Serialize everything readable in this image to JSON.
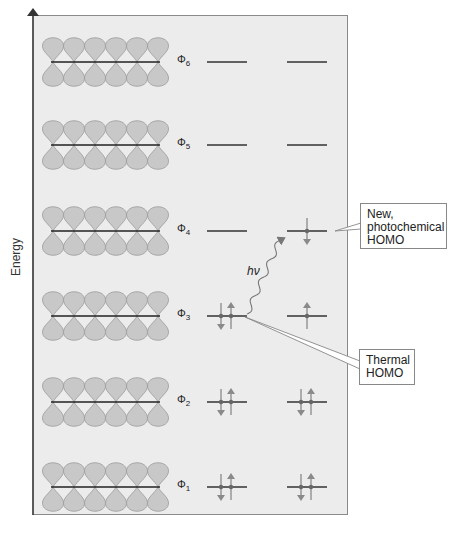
{
  "axis": {
    "label": "Energy"
  },
  "orbitals": [
    {
      "id": "phi6",
      "symbol": "Φ",
      "subscript": "6",
      "y": 62,
      "left_config": "empty",
      "right_config": "empty"
    },
    {
      "id": "phi5",
      "symbol": "Φ",
      "subscript": "5",
      "y": 145,
      "left_config": "empty",
      "right_config": "empty"
    },
    {
      "id": "phi4",
      "symbol": "Φ",
      "subscript": "4",
      "y": 231,
      "left_config": "empty",
      "right_config": "one-down"
    },
    {
      "id": "phi3",
      "symbol": "Φ",
      "subscript": "3",
      "y": 316,
      "left_config": "paired",
      "right_config": "one-up"
    },
    {
      "id": "phi2",
      "symbol": "Φ",
      "subscript": "2",
      "y": 402,
      "left_config": "paired",
      "right_config": "paired"
    },
    {
      "id": "phi1",
      "symbol": "Φ",
      "subscript": "1",
      "y": 487,
      "left_config": "paired",
      "right_config": "paired"
    }
  ],
  "p_orbital_count": 6,
  "excitation": {
    "label": "hν"
  },
  "callouts": {
    "photochemical": {
      "lines": [
        "New,",
        "photochemical",
        "HOMO"
      ]
    },
    "thermal": {
      "lines": [
        "Thermal",
        "HOMO"
      ]
    }
  },
  "colors": {
    "panel_bg": "#ececec",
    "lobe_fill": "#c8c8c8",
    "lobe_stroke": "#9a9a9a",
    "level_line": "#333333",
    "spin_arrow": "#8a8a8a"
  }
}
